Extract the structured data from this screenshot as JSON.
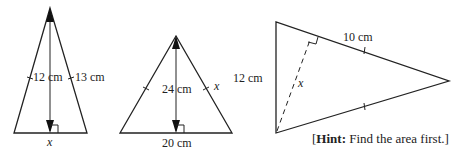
{
  "figures": [
    {
      "id": "triangle-1",
      "altitude_label": "12 cm",
      "side_label": "13 cm",
      "base_label": "x"
    },
    {
      "id": "triangle-2",
      "altitude_label": "24 cm",
      "side_label": "x",
      "base_label": "20 cm"
    },
    {
      "id": "triangle-3",
      "left_label": "12 cm",
      "top_label": "10 cm",
      "dashed_label": "x",
      "hint_bold": "Hint:",
      "hint_text": " Find the area first.]",
      "hint_open": "["
    }
  ]
}
